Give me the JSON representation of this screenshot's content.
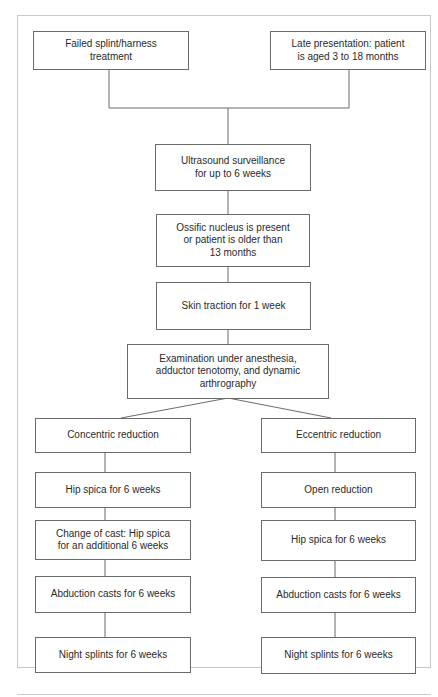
{
  "flowchart": {
    "start_left": "Failed splint/harness\ntreatment",
    "start_right": "Late presentation: patient\nis aged 3 to 18 months",
    "step_ultrasound": "Ultrasound surveillance\nfor up to 6 weeks",
    "step_ossific": "Ossific nucleus is present\nor patient is older than\n13 months",
    "step_traction": "Skin traction for 1 week",
    "step_examination": "Examination under anesthesia,\nadductor tenotomy, and dynamic\narthrography",
    "left_branch": {
      "title": "Concentric reduction",
      "steps": [
        "Hip spica for 6 weeks",
        "Change of cast: Hip spica\nfor an additional 6 weeks",
        "Abduction casts for 6 weeks",
        "Night splints for 6 weeks"
      ]
    },
    "right_branch": {
      "title": "Eccentric reduction",
      "steps": [
        "Open reduction",
        "Hip spica for 6 weeks",
        "Abduction casts for 6 weeks",
        "Night splints for 6 weeks"
      ]
    }
  },
  "colors": {
    "box_border": "#6b6b6b",
    "line": "#6b6b6b",
    "frame_border": "#c9c9c9",
    "text": "#2a2a2a"
  }
}
